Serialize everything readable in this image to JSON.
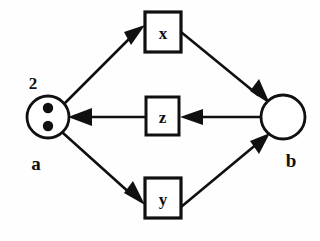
{
  "diagram": {
    "type": "petri-net",
    "title": "",
    "background_color": "#fefefe",
    "stroke_color": "#101010",
    "fill_color": "#ffffff",
    "places": [
      {
        "id": "a",
        "label": "a",
        "label_position": "below",
        "token_count": "2",
        "token_count_position": "above",
        "tokens_drawn": 2,
        "shape": "circle",
        "cx": 48,
        "cy": 117,
        "r": 21
      },
      {
        "id": "b",
        "label": "b",
        "label_position": "below",
        "token_count": "",
        "tokens_drawn": 0,
        "shape": "circle",
        "cx": 283,
        "cy": 117,
        "r": 22
      }
    ],
    "transitions": [
      {
        "id": "x",
        "label": "x",
        "shape": "square",
        "x": 145,
        "y": 12,
        "width": 36,
        "height": 40
      },
      {
        "id": "z",
        "label": "z",
        "shape": "square",
        "x": 146,
        "y": 97,
        "width": 33,
        "height": 38
      },
      {
        "id": "y",
        "label": "y",
        "shape": "square",
        "x": 145,
        "y": 178,
        "width": 36,
        "height": 40
      }
    ],
    "arcs": [
      {
        "id": "a-to-x",
        "from": "a",
        "to": "x",
        "direction": "forward"
      },
      {
        "id": "x-to-b",
        "from": "x",
        "to": "b",
        "direction": "forward"
      },
      {
        "id": "b-to-z",
        "from": "b",
        "to": "z",
        "direction": "forward"
      },
      {
        "id": "z-to-a",
        "from": "z",
        "to": "a",
        "direction": "forward"
      },
      {
        "id": "a-to-y",
        "from": "a",
        "to": "y",
        "direction": "forward"
      },
      {
        "id": "y-to-b",
        "from": "y",
        "to": "b",
        "direction": "forward"
      }
    ]
  }
}
